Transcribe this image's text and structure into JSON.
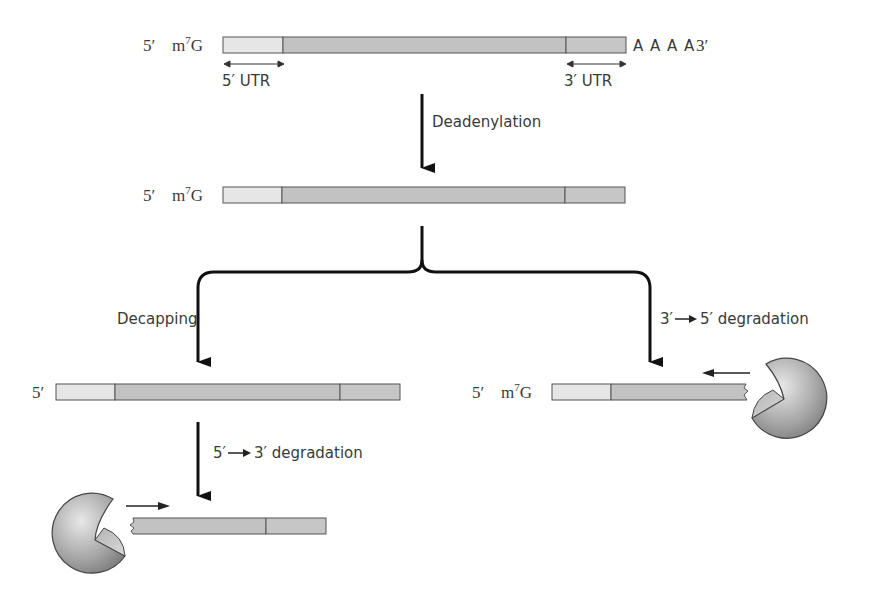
{
  "colors": {
    "utr5": "#e6e6e6",
    "coding": "#c2c2c2",
    "utr3": "#c6c6c6",
    "outline": "#555555",
    "arrow": "#111111",
    "enzyme": "#a8a8a8"
  },
  "stage1": {
    "five_prime": "5′",
    "cap": "m",
    "cap_sup": "7",
    "cap_tail": "G",
    "polyA": "A A A A",
    "three_prime": "3′",
    "utr5_label": "5′ UTR",
    "utr3_label": "3′ UTR"
  },
  "step1": {
    "label": "Deadenylation"
  },
  "stage2": {
    "five_prime": "5′",
    "cap": "m",
    "cap_sup": "7",
    "cap_tail": "G"
  },
  "left_branch": {
    "step_label": "Decapping",
    "product": {
      "five_prime": "5′"
    },
    "degradation": {
      "from": "5′",
      "to": "3′ degradation"
    }
  },
  "right_branch": {
    "step_label_from": "3′",
    "step_label_to": "5′ degradation",
    "product": {
      "five_prime": "5′",
      "cap": "m",
      "cap_sup": "7",
      "cap_tail": "G"
    }
  }
}
